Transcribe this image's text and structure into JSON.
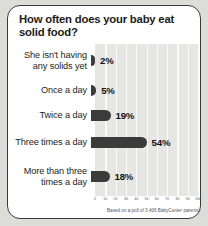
{
  "card": {
    "title": "How often does your baby eat solid food?",
    "footnote": "Based on a poll of 3,406 BabyCenter parents."
  },
  "chart_data": {
    "type": "bar",
    "orientation": "horizontal",
    "title": "How often does your baby eat solid food?",
    "categories": [
      "She isn't having any solids yet",
      "Once a day",
      "Twice a day",
      "Three times a day",
      "More than three times a day"
    ],
    "values": [
      2,
      5,
      19,
      54,
      18
    ],
    "value_labels": [
      "2%",
      "5%",
      "19%",
      "54%",
      "18%"
    ],
    "xlabel": "",
    "ylabel": "",
    "xlim": [
      0,
      100
    ],
    "xticks": [
      0,
      10,
      20,
      30,
      40,
      50,
      60,
      70,
      80,
      90,
      100
    ],
    "xtick_labels": [
      "0",
      "10",
      "20",
      "30",
      "40",
      "50",
      "60",
      "70",
      "80",
      "90",
      "100"
    ],
    "grid": true,
    "legend": false,
    "annotation": "Based on a poll of 3,406 BabyCenter parents.",
    "bar_color": "#3b3b3b",
    "plot_background": "#e6e6e4",
    "gridline_color": "#fafafa"
  }
}
